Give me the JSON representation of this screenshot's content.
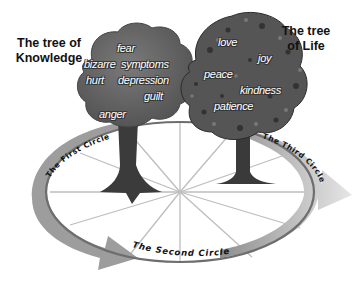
{
  "titles": {
    "knowledge": "The tree of Knowledge",
    "life": "The tree of Life"
  },
  "tree_of_knowledge": {
    "words": [
      "fear",
      "bizarre",
      "symptoms",
      "hurt",
      "depression",
      "guilt",
      "anger"
    ]
  },
  "tree_of_life": {
    "words": [
      "love",
      "joy",
      "peace",
      "kindness",
      "patience"
    ]
  },
  "circles": {
    "first": "The First Circle",
    "second": "The Second Circle",
    "third": "The Third Circle"
  },
  "colors": {
    "knowledge_canopy": "#6a6a6a",
    "life_canopy": "#4a4a4a",
    "trunk": "#3a3a3a",
    "arrow": "#9a9a9a",
    "ring": "#777777",
    "spokes": "#bbbbbb"
  }
}
